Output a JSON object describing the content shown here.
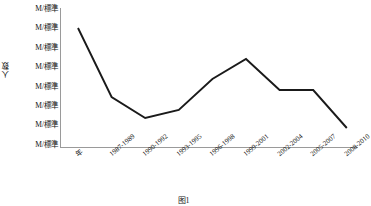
{
  "chart_data": {
    "type": "line",
    "title": "",
    "xlabel": "年",
    "ylabel": "人数",
    "grid": false,
    "legend": "none",
    "categories": [
      "年",
      "1987-1989",
      "1990-1992",
      "1993-1995",
      "1996-1998",
      "1999-2001",
      "2002-2004",
      "2005-2007",
      "2008-2010"
    ],
    "x_tick_labels": [
      "年",
      "1987-1989",
      "1990-1992",
      "1993-1995",
      "1996-1998",
      "1999-2001",
      "2002-2004",
      "2005-2007",
      "2008-2010"
    ],
    "y_tick_labels": [
      "M/標準",
      "M/標準",
      "M/標準",
      "M/標準",
      "M/標準",
      "M/標準",
      "M/標準",
      "M/標準"
    ],
    "ylim": [
      0,
      7
    ],
    "y_tick_values": [
      7,
      6,
      5,
      4,
      3,
      2,
      1,
      0
    ],
    "series": [
      {
        "name": "人数",
        "color": "#1a1a1a",
        "values": [
          6.0,
          2.55,
          1.5,
          1.9,
          3.45,
          4.45,
          2.9,
          2.9,
          1.0
        ]
      }
    ],
    "points": [
      {
        "x": "年",
        "y": 6.0
      },
      {
        "x": "1987-1989",
        "y": 2.55
      },
      {
        "x": "1990-1992",
        "y": 1.5
      },
      {
        "x": "1993-1995",
        "y": 1.9
      },
      {
        "x": "1996-1998",
        "y": 3.45
      },
      {
        "x": "1999-2001",
        "y": 4.45
      },
      {
        "x": "2002-2004",
        "y": 2.9
      },
      {
        "x": "2005-2007",
        "y": 2.9
      },
      {
        "x": "2008-2010",
        "y": 1.0
      }
    ]
  },
  "axis": {
    "y_title": "人数",
    "y_labels": [
      "M/標準",
      "M/標準",
      "M/標準",
      "M/標準",
      "M/標準",
      "M/標準",
      "M/標準",
      "M/標準"
    ],
    "x_labels": [
      "年",
      "1987-1989",
      "1990-1992",
      "1993-1995",
      "1996-1998",
      "1999-2001",
      "2002-2004",
      "2005-2007",
      "2008-2010"
    ],
    "axis_color": "#9a9a9a",
    "line_color": "#1a1a1a"
  },
  "caption": {
    "text": "图1"
  }
}
